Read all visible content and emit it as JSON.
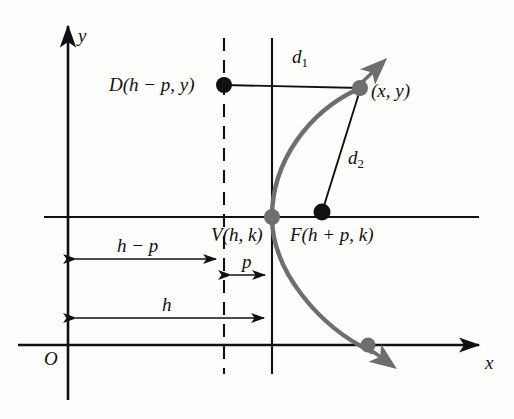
{
  "figure": {
    "type": "geometry-diagram",
    "background_color": "#fdfdfc",
    "ink_color": "#111111",
    "curve_color": "#6e6e6e"
  },
  "axes": {
    "y_label": "y",
    "x_label": "x",
    "origin_label": "O",
    "y_axis_x": 68,
    "x_axis_y": 345,
    "y_axis_top": 22,
    "x_axis_right": 487
  },
  "points": {
    "directrix_point": {
      "label": "D(h − p, y)",
      "x": 224,
      "y": 85,
      "dot_color": "#111111"
    },
    "parabola_point": {
      "label": "(x, y)",
      "x": 360,
      "y": 88,
      "dot_color": "#6e6e6e"
    },
    "vertex": {
      "label": "V(h, k)",
      "x": 272,
      "y": 217,
      "dot_color": "#6e6e6e"
    },
    "focus": {
      "label": "F(h + p, k)",
      "x": 322,
      "y": 212,
      "dot_color": "#111111"
    },
    "curve_x_crossing": {
      "x": 368,
      "y": 345,
      "dot_color": "#6e6e6e"
    }
  },
  "distances": {
    "d1": {
      "label": "d",
      "subscript": "1",
      "x": 296,
      "y": 55,
      "from": "directrix_point",
      "to": "parabola_point"
    },
    "d2": {
      "label": "d",
      "subscript": "2",
      "x": 352,
      "y": 155,
      "from": "parabola_point",
      "to": "focus"
    }
  },
  "dimensions": [
    {
      "name": "h-minus-p",
      "label": "h − p",
      "label_x": 125,
      "label_y": 240,
      "line_y": 259,
      "from_x": 68,
      "to_x": 224
    },
    {
      "name": "p",
      "label": "p",
      "label_x": 240,
      "label_y": 258,
      "line_y": 275,
      "from_x": 224,
      "to_x": 272
    },
    {
      "name": "h",
      "label": "h",
      "label_x": 162,
      "label_y": 299,
      "line_y": 318,
      "from_x": 68,
      "to_x": 272
    }
  ],
  "guides": {
    "directrix_x": 224,
    "vertex_line_x": 272,
    "latus_line_y": 217,
    "directrix_style": "dashed",
    "vertex_line_style": "solid"
  }
}
